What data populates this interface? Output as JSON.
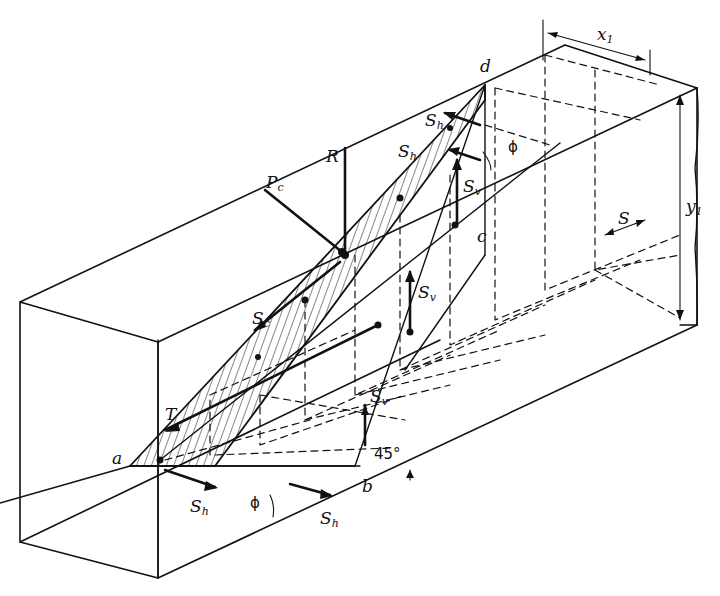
{
  "diagram": {
    "ink_color": "#111111",
    "background": "#ffffff",
    "points": {
      "a": "a",
      "b": "b",
      "c": "c",
      "d": "d"
    },
    "forces": {
      "R": "R",
      "Pc": {
        "base": "P",
        "sub": "c"
      },
      "Sc": {
        "base": "S",
        "sub": "c"
      },
      "T": "T",
      "Sh": {
        "base": "S",
        "sub": "h"
      },
      "Sv": {
        "base": "S",
        "sub": "v"
      }
    },
    "dimensions": {
      "x1": {
        "base": "x",
        "sub": "1"
      },
      "y1": {
        "base": "y",
        "sub": "1"
      },
      "S": "S"
    },
    "angles": {
      "phi": "ϕ",
      "deg45": "45°"
    }
  }
}
